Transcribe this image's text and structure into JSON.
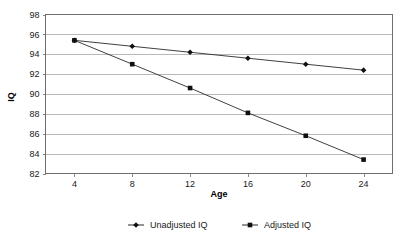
{
  "chart_data": {
    "type": "line",
    "title": "",
    "xlabel": "Age",
    "ylabel": "IQ",
    "x": [
      4,
      8,
      12,
      16,
      20,
      24
    ],
    "xticklabels": [
      "4",
      "8",
      "12",
      "16",
      "20",
      "24"
    ],
    "yticks": [
      82,
      84,
      86,
      88,
      90,
      92,
      94,
      96,
      98
    ],
    "yticklabels": [
      "82",
      "84",
      "86",
      "88",
      "90",
      "92",
      "94",
      "96",
      "98"
    ],
    "xlim": [
      2,
      26
    ],
    "ylim": [
      82,
      98
    ],
    "grid": "horizontal",
    "legend_position": "bottom-center",
    "series": [
      {
        "name": "Unadjusted IQ",
        "marker": "diamond",
        "color": "#101010",
        "values": [
          95.4,
          94.8,
          94.2,
          93.6,
          93.0,
          92.4
        ]
      },
      {
        "name": "Adjusted IQ",
        "marker": "square",
        "color": "#101010",
        "values": [
          95.4,
          93.0,
          90.6,
          88.1,
          85.8,
          83.4
        ]
      }
    ]
  },
  "legend": {
    "items": [
      {
        "label": "Unadjusted IQ"
      },
      {
        "label": "Adjusted IQ"
      }
    ]
  },
  "axes": {
    "x_title": "Age",
    "y_title": "IQ"
  }
}
